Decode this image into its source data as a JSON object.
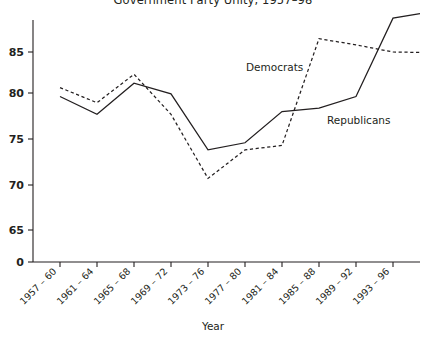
{
  "chart_data": {
    "type": "line",
    "title": "Government Party Unity, 1957–98",
    "xlabel": "Year",
    "ylabel": "",
    "categories": [
      "1957 – 60",
      "1961 – 64",
      "1965 – 68",
      "1969 – 72",
      "1973 – 76",
      "1977 – 80",
      "1981 – 84",
      "1985 – 88",
      "1989 – 92",
      "1993 – 96"
    ],
    "series": [
      {
        "name": "Democrats",
        "style": "dashed",
        "values": [
          81.0,
          79.3,
          82.5,
          78.0,
          70.8,
          74.0,
          74.5,
          86.5,
          85.8,
          85.0
        ]
      },
      {
        "name": "Republicans",
        "style": "solid",
        "values": [
          80.0,
          78.0,
          81.5,
          80.3,
          74.0,
          74.8,
          78.3,
          78.7,
          80.0,
          88.8
        ]
      }
    ],
    "ytick_labels": [
      "0",
      "65",
      "70",
      "75",
      "80",
      "85"
    ],
    "ytick_values": [
      0,
      65,
      70,
      75,
      80,
      85
    ],
    "ylim": [
      63.5,
      90.5
    ],
    "y_axis_broken": true,
    "grid": false,
    "legend_position": "inline-annotations",
    "annotations": [
      {
        "text": "Democrats",
        "x_px": 246,
        "y_px": 71
      },
      {
        "text": "Republicans",
        "x_px": 327,
        "y_px": 124
      }
    ],
    "colors": {
      "line": "#231f20",
      "axis": "#231f20",
      "background": "#ffffff"
    }
  }
}
